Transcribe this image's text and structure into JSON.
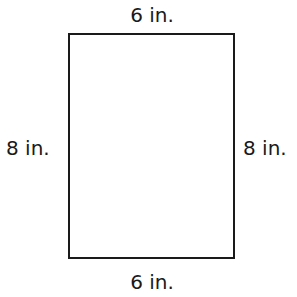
{
  "diagram": {
    "shape": "rectangle",
    "labels": {
      "top": "6 in.",
      "bottom": "6 in.",
      "left": "8 in.",
      "right": "8 in."
    },
    "stroke_color": "#1a1a1a"
  }
}
